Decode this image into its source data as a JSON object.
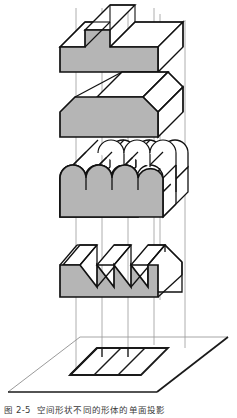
{
  "figure": {
    "label": "图 2-5",
    "caption_text": "空间形状不同的形体的单面投影",
    "full_caption": "图 2-5  空间形状不同的形体的单面投影"
  },
  "colors": {
    "solid_fill_gray": "#b5b5b5",
    "face_white": "#ffffff",
    "outline_dark": "#111111",
    "projector_line": "#9a9a9a",
    "plane_edge": "#1a1a1a",
    "plane_edge_light": "#8f8f8f",
    "background": "#ffffff",
    "caption_text": "#3a3a3a"
  },
  "drawing": {
    "projection_type": "single-view-orthographic",
    "solids_count": 4,
    "projectors_count": 4,
    "shared_footprint_cells": 3,
    "solids": [
      {
        "index": 1,
        "name": "stepped-t-block",
        "description": "T-shaped stepped extruded block",
        "front_face_fill": "#b5b5b5",
        "top_face_fill": "#ffffff"
      },
      {
        "index": 2,
        "name": "trapezoidal-prism",
        "description": "Trapezoidal prism with sloped end faces",
        "front_face_fill": "#b5b5b5",
        "top_face_fill": "#ffffff"
      },
      {
        "index": 3,
        "name": "triple-arch-vault",
        "description": "Prism with three semicircular arch tops",
        "front_face_fill": "#b5b5b5",
        "top_face_fill": "#ffffff"
      },
      {
        "index": 4,
        "name": "sawtooth-roof-prism",
        "description": "Prism with three sawtooth (zigzag) roof teeth",
        "front_face_fill": "#b5b5b5",
        "top_face_fill": "#ffffff"
      }
    ],
    "projection_plane": {
      "name": "horizontal-projection-plane",
      "shape": "parallelogram"
    },
    "projected_outline": {
      "name": "common-projection-rectangle",
      "shape": "parallelogram",
      "divisions": 3
    }
  }
}
